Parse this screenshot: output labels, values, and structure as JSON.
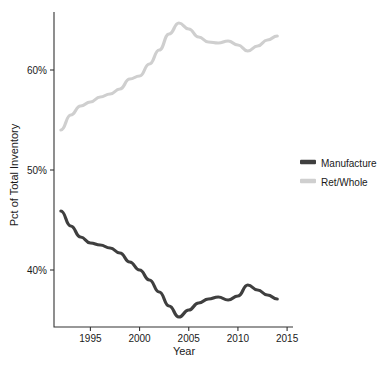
{
  "chart_data": {
    "type": "line",
    "title": "",
    "xlabel": "Year",
    "ylabel": "Pct of Total Inventory",
    "xlim": [
      1991.3,
      2015.6
    ],
    "ylim": [
      34.3,
      65.8
    ],
    "grid": false,
    "legend_position": "right",
    "x_ticks": [
      1995,
      2000,
      2005,
      2010,
      2015
    ],
    "x_tick_labels": [
      "1995",
      "2000",
      "2005",
      "2010",
      "2015"
    ],
    "y_ticks": [
      40,
      50,
      60
    ],
    "y_tick_labels": [
      "40%",
      "50%",
      "60%"
    ],
    "x": [
      1992,
      1993,
      1994,
      1995,
      1996,
      1997,
      1998,
      1999,
      2000,
      2001,
      2002,
      2003,
      2004,
      2005,
      2006,
      2007,
      2008,
      2009,
      2010,
      2011,
      2012,
      2013,
      2014
    ],
    "series": [
      {
        "name": "Manufacture",
        "color": "#3f3f3f",
        "values": [
          45.9,
          44.4,
          43.3,
          42.7,
          42.5,
          42.2,
          41.7,
          40.8,
          40.0,
          39.0,
          37.8,
          36.4,
          35.3,
          36.0,
          36.7,
          37.1,
          37.3,
          37.0,
          37.4,
          38.5,
          38.0,
          37.5,
          37.1
        ]
      },
      {
        "name": "Ret/Whole",
        "color": "#cfcfcf",
        "values": [
          54.0,
          55.5,
          56.4,
          56.8,
          57.3,
          57.6,
          58.1,
          59.1,
          59.4,
          60.6,
          62.0,
          63.6,
          64.7,
          64.1,
          63.3,
          62.8,
          62.7,
          62.9,
          62.5,
          61.9,
          62.4,
          63.0,
          63.4
        ]
      }
    ]
  },
  "legend": {
    "entries": [
      {
        "label": "Manufacture",
        "swatch_color": "#3f3f3f"
      },
      {
        "label": "Ret/Whole",
        "swatch_color": "#cfcfcf"
      }
    ]
  }
}
